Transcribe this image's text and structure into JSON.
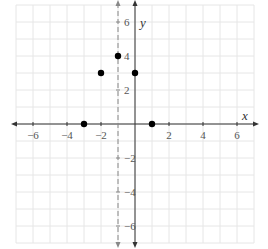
{
  "chart_data": {
    "type": "scatter",
    "title": "",
    "xlabel": "x",
    "ylabel": "y",
    "xlim": [
      -7,
      7
    ],
    "ylim": [
      -7,
      7
    ],
    "grid": true,
    "legend": null,
    "x_ticks": [
      -6,
      -4,
      -2,
      2,
      4,
      6
    ],
    "y_ticks": [
      6,
      4,
      2,
      -2,
      -4,
      -6
    ],
    "x_tick_labels": [
      "−6",
      "−4",
      "−2",
      "2",
      "4",
      "6"
    ],
    "y_tick_labels": [
      "6",
      "4",
      "2",
      "−2",
      "−4",
      "−6"
    ],
    "series": [
      {
        "name": "points",
        "x": [
          -3,
          -2,
          -1,
          0,
          1
        ],
        "y": [
          0,
          3,
          4,
          3,
          0
        ]
      }
    ],
    "annotations": [
      {
        "type": "vertical-dashed-line",
        "x": -1,
        "label": "x = -1 (axis of symmetry)"
      }
    ]
  },
  "colors": {
    "grid": "#e6e6e6",
    "axis": "#333333",
    "dashed_line": "#888888",
    "point": "#000000",
    "label": "#555555"
  }
}
